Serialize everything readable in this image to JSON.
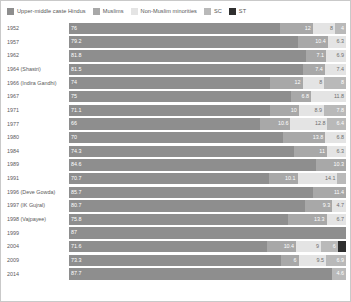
{
  "legend": {
    "items": [
      {
        "label": "Upper-middle caste Hindus",
        "color": "#8e8e8e",
        "key": "upper_middle_caste_hindus"
      },
      {
        "label": "Muslims",
        "color": "#a8a8a8",
        "key": "muslims"
      },
      {
        "label": "Non-Muslim minorities",
        "color": "#e4e4e4",
        "key": "non_muslim_minorities"
      },
      {
        "label": "SC",
        "color": "#b9b9b9",
        "key": "sc"
      },
      {
        "label": "ST",
        "color": "#2f2f2f",
        "key": "st"
      }
    ]
  },
  "chart_data": {
    "type": "bar",
    "orientation": "horizontal",
    "stacked": true,
    "normalized_percent": true,
    "title": "",
    "subtitle": "",
    "xlabel": "",
    "ylabel": "",
    "xlim": [
      0,
      100
    ],
    "grid": false,
    "legend_position": "top-left",
    "categories": [
      "1952",
      "1957",
      "1962",
      "1964 (Shastri)",
      "1966 (Indira Gandhi)",
      "1967",
      "1971",
      "1977",
      "1980",
      "1984",
      "1989",
      "1991",
      "1996 (Deve Gowda)",
      "1997 (IK Gujral)",
      "1998 (Vajpayee)",
      "1999",
      "2004",
      "2009",
      "2014"
    ],
    "series": [
      {
        "name": "Upper-middle caste Hindus",
        "color": "#8e8e8e",
        "values": [
          76,
          79.2,
          81.8,
          81.5,
          74,
          75,
          71.1,
          66,
          70,
          74.3,
          84.6,
          70.7,
          85.7,
          80.7,
          75.8,
          87,
          71.6,
          73.3,
          87.7
        ]
      },
      {
        "name": "Muslims",
        "color": "#a8a8a8",
        "values": [
          12,
          10.4,
          7.1,
          7.4,
          12,
          6.8,
          10,
          10.6,
          13.8,
          11,
          10.3,
          10.1,
          11.4,
          9.3,
          13.3,
          null,
          10.4,
          6,
          null
        ]
      },
      {
        "name": "Non-Muslim minorities",
        "color": "#e4e4e4",
        "values": [
          8,
          6.3,
          6.9,
          7.4,
          8,
          11.8,
          8.9,
          12.8,
          6.8,
          6.3,
          null,
          14.1,
          null,
          4.7,
          6.7,
          null,
          9,
          9.5,
          null
        ]
      },
      {
        "name": "SC",
        "color": "#b9b9b9",
        "values": [
          4,
          null,
          null,
          null,
          8,
          null,
          7.8,
          6.4,
          null,
          null,
          null,
          3,
          null,
          null,
          null,
          null,
          6,
          6.9,
          4.6
        ]
      },
      {
        "name": "ST",
        "color": "#2f2f2f",
        "values": [
          null,
          null,
          null,
          null,
          null,
          null,
          null,
          null,
          null,
          null,
          null,
          null,
          null,
          null,
          null,
          null,
          3,
          null,
          null
        ]
      }
    ]
  }
}
